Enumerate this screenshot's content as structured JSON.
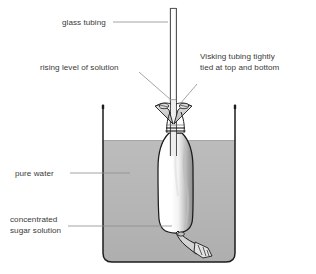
{
  "figure": {
    "background_color": "#ffffff",
    "width": 316,
    "height": 274
  },
  "colors": {
    "outline": "#1c1c1c",
    "leader_line": "#8d8d8d",
    "label_text": "#3a3a3a",
    "water_fill": "#b8b8b8",
    "water_fill_dark": "#ababab",
    "bag_fill": "#ffffff",
    "bag_shade": "#9a9a9a",
    "glass_tube": "#555555",
    "tie_fill": "#cfcfcf"
  },
  "labels": {
    "glass_tubing": {
      "text": "glass tubing",
      "lines": [
        "glass tubing"
      ],
      "x": 62,
      "y": 25
    },
    "rising_level": {
      "text": "rising level of solution",
      "lines": [
        "rising level of solution"
      ],
      "x": 40,
      "y": 70
    },
    "visking_tubing": {
      "text": "Visking tubing tightly tied at top and bottom",
      "lines": [
        "Visking tubing tightly",
        "tied at top and bottom"
      ],
      "x": 200,
      "y": 62
    },
    "pure_water": {
      "text": "pure water",
      "lines": [
        "pure water"
      ],
      "x": 15,
      "y": 175
    },
    "sugar_solution": {
      "text": "concentrated sugar solution",
      "lines": [
        "concentrated",
        "sugar solution"
      ],
      "x": 10,
      "y": 221
    }
  },
  "apparatus": {
    "beaker": {
      "name": "beaker",
      "left": 103,
      "right": 235,
      "top": 105,
      "bottom": 262,
      "corner_radius": 9
    },
    "water_level_y": 140,
    "glass_tube": {
      "name": "glass-tubing",
      "left_wall_x": 170,
      "right_wall_x": 176.5,
      "top_y": 8,
      "bottom_y": 156
    },
    "visking_bag": {
      "name": "visking-tubing-bag",
      "top_y": 133,
      "bottom_y": 233,
      "left_x": 158,
      "right_x": 193
    },
    "top_tie_y": 105,
    "bottom_tie_y": 233,
    "solution_level_y": 100
  }
}
